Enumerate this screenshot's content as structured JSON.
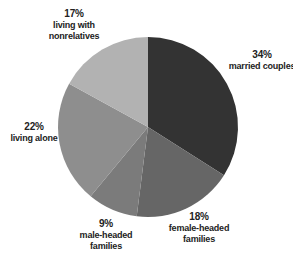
{
  "chart_data": {
    "type": "pie",
    "title": "",
    "start_angle": "12 o'clock",
    "direction": "clockwise",
    "slices": [
      {
        "label": "married couples",
        "value": 34,
        "pct_text": "34%",
        "color": "#333333"
      },
      {
        "label": "female-headed families",
        "value": 18,
        "pct_text": "18%",
        "color": "#666666"
      },
      {
        "label": "male-headed families",
        "value": 9,
        "pct_text": "9%",
        "color": "#7b7b7b"
      },
      {
        "label": "living alone",
        "value": 22,
        "pct_text": "22%",
        "color": "#8e8e8e"
      },
      {
        "label": "living with nonrelatives",
        "value": 17,
        "pct_text": "17%",
        "color": "#b2b2b2"
      }
    ]
  },
  "labels": {
    "married": {
      "pct": "34%",
      "line1": "married couples"
    },
    "female": {
      "pct": "18%",
      "line1": "female-headed",
      "line2": "families"
    },
    "male": {
      "pct": "9%",
      "line1": "male-headed",
      "line2": "families"
    },
    "alone": {
      "pct": "22%",
      "line1": "living alone"
    },
    "nonrel": {
      "pct": "17%",
      "line1": "living with",
      "line2": "nonrelatives"
    }
  }
}
